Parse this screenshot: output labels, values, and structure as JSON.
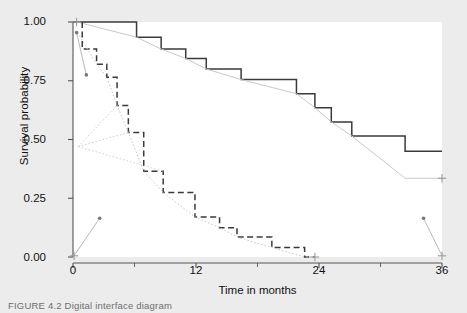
{
  "figure": {
    "background_color": "#ececed",
    "panel_color": "#ffffff"
  },
  "caption": {
    "text": "FIGURE 4.2   Digital interface diagram"
  },
  "chart_data": {
    "type": "line",
    "title": "",
    "subtitle": "",
    "xlabel": "Time in months",
    "ylabel": "Survival probability",
    "xlim": [
      0,
      36
    ],
    "ylim": [
      0.0,
      1.0
    ],
    "xticks": [
      0,
      12,
      24,
      36
    ],
    "xticklabels": [
      "0",
      "12",
      "24",
      "36"
    ],
    "xminorticks": [
      6,
      18,
      30
    ],
    "yticks": [
      0.0,
      0.25,
      0.5,
      0.75,
      1.0
    ],
    "yticklabels": [
      "0.00",
      "0.25",
      "0.50",
      "0.75",
      "1.00"
    ],
    "grid": false,
    "legend": "none",
    "colors": {
      "solid_step": "#3a3a3a",
      "dashed_step": "#3a3a3a",
      "overlay": "#c9c9c9",
      "axis": "#555555"
    },
    "series": [
      {
        "name": "Group A survival (solid step)",
        "style": "step-solid",
        "color": "#3a3a3a",
        "x": [
          0,
          0.4,
          6.2,
          6.2,
          8.6,
          8.6,
          11.0,
          11.0,
          13.0,
          13.0,
          16.4,
          16.4,
          21.8,
          21.8,
          23.6,
          23.6,
          25.2,
          25.2,
          27.2,
          27.2,
          32.4,
          32.4,
          36.0
        ],
        "y": [
          1.0,
          1.0,
          1.0,
          0.935,
          0.935,
          0.885,
          0.885,
          0.845,
          0.845,
          0.8,
          0.8,
          0.755,
          0.755,
          0.695,
          0.695,
          0.635,
          0.635,
          0.575,
          0.575,
          0.515,
          0.515,
          0.45,
          0.45
        ]
      },
      {
        "name": "Group A fitted (gray overlay)",
        "style": "line-solid",
        "color": "#c9c9c9",
        "x": [
          0.4,
          6.2,
          8.6,
          11.0,
          13.0,
          16.4,
          21.8,
          23.6,
          25.2,
          27.2,
          32.4,
          36.0
        ],
        "y": [
          1.0,
          0.935,
          0.885,
          0.845,
          0.8,
          0.755,
          0.695,
          0.635,
          0.575,
          0.515,
          0.335,
          0.335
        ]
      },
      {
        "name": "Group B survival (dashed step)",
        "style": "step-dashed",
        "color": "#3a3a3a",
        "x": [
          0.9,
          0.9,
          2.3,
          2.3,
          3.3,
          3.3,
          4.3,
          4.3,
          5.4,
          5.4,
          6.9,
          6.9,
          8.8,
          8.8,
          11.9,
          11.9,
          14.3,
          14.3,
          16.0,
          16.0,
          19.4,
          19.4,
          22.6,
          22.6,
          23.6
        ],
        "y": [
          1.0,
          0.885,
          0.885,
          0.82,
          0.82,
          0.765,
          0.765,
          0.645,
          0.645,
          0.53,
          0.53,
          0.365,
          0.365,
          0.275,
          0.275,
          0.17,
          0.17,
          0.125,
          0.125,
          0.085,
          0.085,
          0.04,
          0.04,
          0.0,
          0.0
        ]
      },
      {
        "name": "Group B fitted (gray overlay)",
        "style": "line-dotted",
        "color": "#c9c9c9",
        "x": [
          0.45,
          2.3,
          3.3,
          4.3,
          5.4,
          6.9,
          8.8,
          11.9,
          14.3,
          16.0,
          19.4,
          22.6,
          23.6
        ],
        "y": [
          0.955,
          0.82,
          0.765,
          0.645,
          0.53,
          0.365,
          0.275,
          0.17,
          0.125,
          0.085,
          0.04,
          0.0,
          0.0
        ]
      },
      {
        "name": "Fan overlay upper",
        "style": "line-dotted",
        "color": "#d2d2d2",
        "x": [
          0.5,
          4.3
        ],
        "y": [
          0.47,
          0.645
        ]
      },
      {
        "name": "Fan overlay middle",
        "style": "line-dotted",
        "color": "#d2d2d2",
        "x": [
          0.5,
          5.4
        ],
        "y": [
          0.47,
          0.53
        ]
      },
      {
        "name": "Fan overlay lower",
        "style": "line-dotted",
        "color": "#d2d2d2",
        "x": [
          0.5,
          8.8
        ],
        "y": [
          0.47,
          0.365
        ]
      },
      {
        "name": "Left marker descent",
        "style": "line-solid",
        "color": "#b8b8b8",
        "x": [
          0.35,
          1.3
        ],
        "y": [
          0.955,
          0.775
        ]
      },
      {
        "name": "Bottom left ascent",
        "style": "line-solid",
        "color": "#b8b8b8",
        "x": [
          0.1,
          2.6
        ],
        "y": [
          0.005,
          0.165
        ]
      },
      {
        "name": "Bottom right descent",
        "style": "line-solid",
        "color": "#b8b8b8",
        "x": [
          34.2,
          36.0
        ],
        "y": [
          0.165,
          0.005
        ]
      }
    ],
    "markers": [
      {
        "name": "censor-plus-origin-top",
        "x": 0.35,
        "y": 1.0,
        "glyph": "plus"
      },
      {
        "name": "point-upper-left-a",
        "x": 0.35,
        "y": 0.955,
        "glyph": "dot"
      },
      {
        "name": "point-upper-left-b",
        "x": 1.3,
        "y": 0.775,
        "glyph": "dot"
      },
      {
        "name": "censor-plus-origin-bottom",
        "x": 0.1,
        "y": 0.005,
        "glyph": "plus"
      },
      {
        "name": "point-lower-left",
        "x": 2.6,
        "y": 0.165,
        "glyph": "dot"
      },
      {
        "name": "point-lower-right",
        "x": 34.2,
        "y": 0.165,
        "glyph": "dot"
      },
      {
        "name": "censor-plus-end-bottom",
        "x": 36.0,
        "y": 0.005,
        "glyph": "plus"
      },
      {
        "name": "censor-plus-end-solid",
        "x": 36.0,
        "y": 0.335,
        "glyph": "plus"
      },
      {
        "name": "censor-plus-end-dashed",
        "x": 23.6,
        "y": 0.0,
        "glyph": "plus"
      }
    ]
  }
}
